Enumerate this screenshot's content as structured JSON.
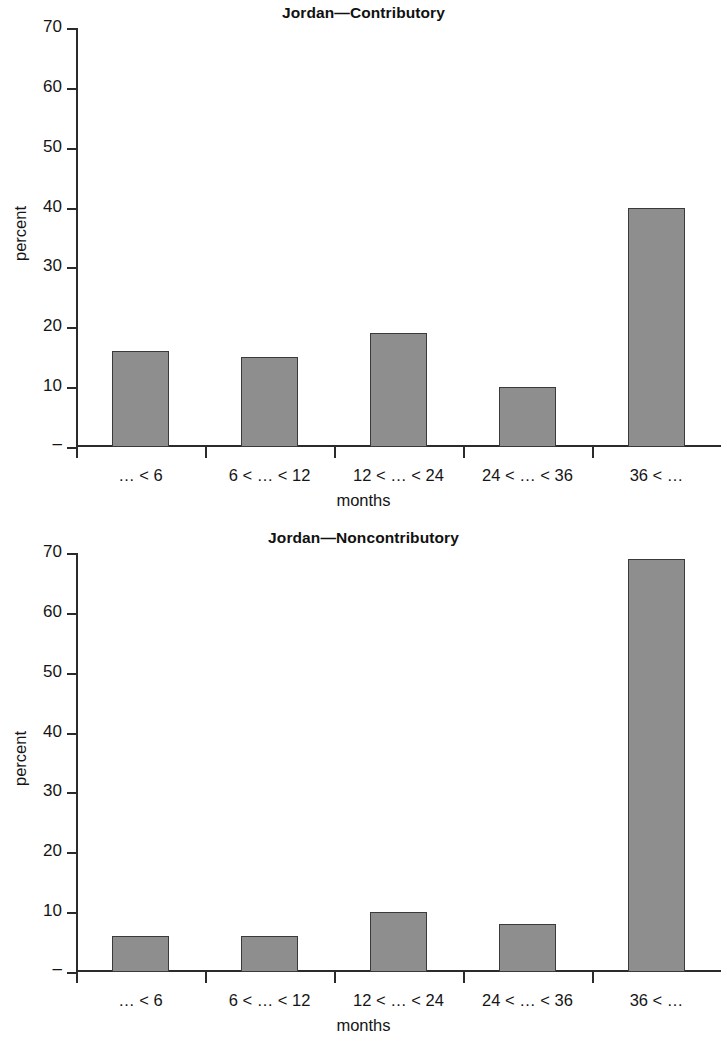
{
  "figure": {
    "background": "#ffffff",
    "bar_fill": "#8e8e8e",
    "bar_stroke": "#3a3a3a",
    "axis_color": "#2b2b2b"
  },
  "charts": [
    {
      "title": "Jordan—Contributory",
      "xlabel": "months",
      "ylabel": "percent"
    },
    {
      "title": "Jordan—Noncontributory",
      "xlabel": "months",
      "ylabel": "percent"
    }
  ],
  "chart_data": [
    {
      "type": "bar",
      "title": "Jordan—Contributory",
      "xlabel": "months",
      "ylabel": "percent",
      "categories": [
        "… < 6",
        "6 < … < 12",
        "12 < … < 24",
        "24 < … < 36",
        "36 < …"
      ],
      "values": [
        16,
        15,
        19,
        10,
        40
      ],
      "ylim": [
        0,
        70
      ],
      "yticks": [
        0,
        10,
        20,
        30,
        40,
        50,
        60,
        70
      ],
      "ytick_labels": [
        "–",
        "10",
        "20",
        "30",
        "40",
        "50",
        "60",
        "70"
      ],
      "grid": false,
      "legend": false
    },
    {
      "type": "bar",
      "title": "Jordan—Noncontributory",
      "xlabel": "months",
      "ylabel": "percent",
      "categories": [
        "… < 6",
        "6 < … < 12",
        "12 < … < 24",
        "24 < … < 36",
        "36 < …"
      ],
      "values": [
        6,
        6,
        10,
        8,
        69
      ],
      "ylim": [
        0,
        70
      ],
      "yticks": [
        0,
        10,
        20,
        30,
        40,
        50,
        60,
        70
      ],
      "ytick_labels": [
        "–",
        "10",
        "20",
        "30",
        "40",
        "50",
        "60",
        "70"
      ],
      "grid": false,
      "legend": false
    }
  ]
}
